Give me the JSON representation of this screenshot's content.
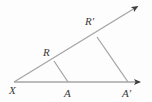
{
  "figure": {
    "type": "geometry-diagram",
    "background_color": "#fdfdfd",
    "line_color": "#9a9a9a",
    "label_color": "#3a3a3a",
    "points": [
      {
        "id": "X",
        "label": "X",
        "x": 14,
        "y": 82,
        "label_x": 9,
        "label_y": 85
      },
      {
        "id": "A",
        "label": "A",
        "x": 68,
        "y": 82,
        "label_x": 64,
        "label_y": 88
      },
      {
        "id": "Aprime",
        "label": "A'",
        "x": 128,
        "y": 82,
        "label_x": 122,
        "label_y": 88
      },
      {
        "id": "R",
        "label": "R",
        "x": 54,
        "y": 61,
        "label_x": 43,
        "label_y": 47
      },
      {
        "id": "Rprime",
        "label": "R'",
        "x": 97,
        "y": 37,
        "label_x": 85,
        "label_y": 16
      }
    ],
    "rays": [
      {
        "id": "ray-horizontal",
        "from": "X",
        "through": "A'",
        "tip_x": 146,
        "tip_y": 82
      },
      {
        "id": "ray-upper",
        "from": "X",
        "through": "R'",
        "tip_x": 143,
        "tip_y": 3
      }
    ],
    "segments": [
      {
        "id": "segment-RA",
        "from": "R",
        "to": "A"
      },
      {
        "id": "segment-RpAp",
        "from": "Rprime",
        "to": "Aprime"
      }
    ]
  }
}
